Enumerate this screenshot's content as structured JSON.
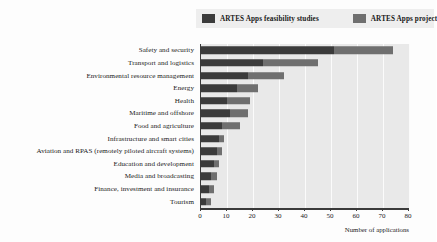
{
  "chart_data": {
    "type": "bar",
    "orientation": "horizontal",
    "stacked": true,
    "title": "",
    "xlabel": "Number of applications",
    "ylabel": "",
    "xlim": [
      0,
      80
    ],
    "xticks": [
      0,
      10,
      20,
      30,
      40,
      50,
      60,
      70,
      80
    ],
    "grid": true,
    "legend_position": "top-right",
    "categories": [
      "Safety and security",
      "Transport and logistics",
      "Environmental resource management",
      "Energy",
      "Health",
      "Maritime and offshore",
      "Food and agriculture",
      "Infrastructure and smart cities",
      "Aviation and RPAS (remotely piloted aircraft systems)",
      "Education and development",
      "Media and broadcasting",
      "Finance, investment and insurance",
      "Tourism"
    ],
    "series": [
      {
        "name": "ARTES Apps feasibility studies",
        "color": "#3b3b3b",
        "values": [
          51,
          24,
          18,
          14,
          10,
          11,
          8,
          7,
          6,
          5,
          4,
          3,
          2
        ]
      },
      {
        "name": "ARTES Apps project",
        "color": "#6f6f6f",
        "values": [
          23,
          21,
          14,
          8,
          9,
          7,
          7,
          2,
          2,
          2,
          2,
          2,
          2
        ]
      }
    ],
    "totals": [
      74,
      45,
      32,
      22,
      19,
      18,
      15,
      9,
      8,
      7,
      6,
      5,
      4
    ]
  },
  "legend": {
    "entries": [
      {
        "label": "ARTES Apps feasibility studies"
      },
      {
        "label": "ARTES Apps project"
      }
    ]
  },
  "axis": {
    "x_title": "Number of applications"
  }
}
